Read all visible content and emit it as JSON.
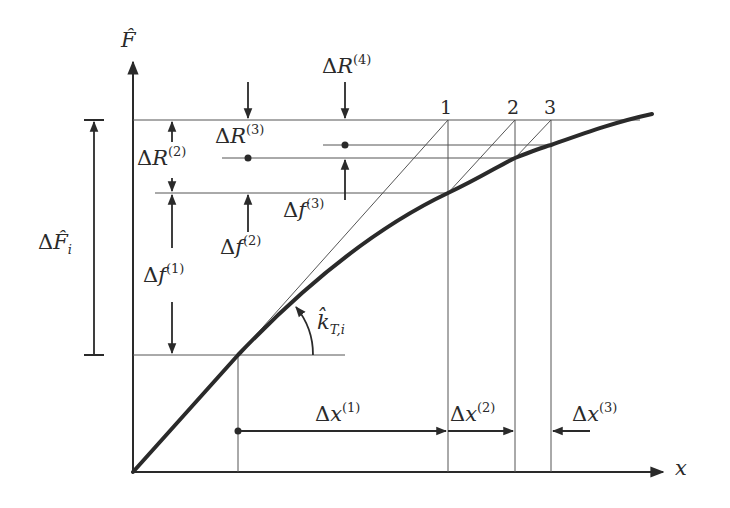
{
  "diagram": {
    "type": "Newton-Raphson / modified stiffness iteration on force-displacement curve",
    "axes": {
      "y_label": "F̂",
      "x_label": "x"
    },
    "labels": {
      "delta_F_i": {
        "prefix": "Δ",
        "symbol": "F̂",
        "sub": "i"
      },
      "delta_R_2": {
        "prefix": "Δ",
        "symbol": "R",
        "sup": "(2)"
      },
      "delta_R_3": {
        "prefix": "Δ",
        "symbol": "R",
        "sup": "(3)"
      },
      "delta_R_4": {
        "prefix": "Δ",
        "symbol": "R",
        "sup": "(4)"
      },
      "delta_f_1": {
        "prefix": "Δ",
        "symbol": "f",
        "sup": "(1)"
      },
      "delta_f_2": {
        "prefix": "Δ",
        "symbol": "f",
        "sup": "(2)"
      },
      "delta_f_3": {
        "prefix": "Δ",
        "symbol": "f",
        "sup": "(3)"
      },
      "delta_x_1": {
        "prefix": "Δ",
        "symbol": "x",
        "sup": "(1)"
      },
      "delta_x_2": {
        "prefix": "Δ",
        "symbol": "x",
        "sup": "(2)"
      },
      "delta_x_3": {
        "prefix": "Δ",
        "symbol": "x",
        "sup": "(3)"
      },
      "k_T_i": {
        "symbol": "k̂",
        "sub": "T,i"
      }
    },
    "iteration_markers": [
      "1",
      "2",
      "3"
    ],
    "colors": {
      "ink": "#2a2a2a",
      "curve": "#2a2a2a",
      "background": "#ffffff"
    }
  }
}
